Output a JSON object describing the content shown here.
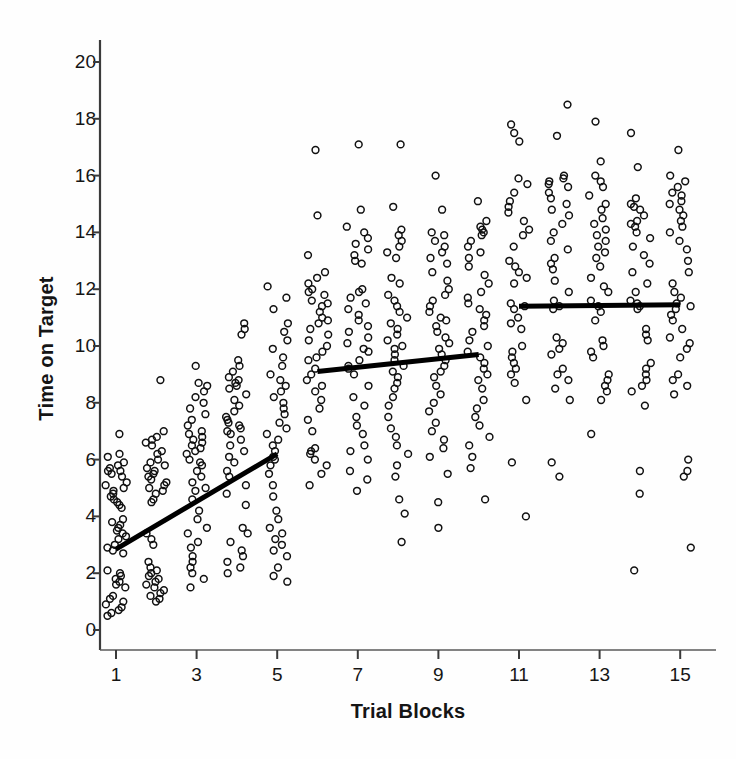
{
  "chart_data": {
    "type": "scatter",
    "title": "",
    "xlabel": "Trial Blocks",
    "ylabel": "Time on Target",
    "xlim": [
      0.3,
      15.8
    ],
    "ylim": [
      0,
      20.9
    ],
    "xticks": [
      1,
      3,
      5,
      7,
      9,
      11,
      13,
      15
    ],
    "yticks": [
      0,
      2,
      4,
      6,
      8,
      10,
      12,
      14,
      16,
      18,
      20
    ],
    "grid": false,
    "legend": null,
    "marker": "open-circle",
    "trendlines": [
      {
        "name": "phase-1-fit",
        "x0": 1.0,
        "y0": 2.85,
        "x1": 5.0,
        "y1": 6.2
      },
      {
        "name": "phase-2-fit",
        "x0": 6.0,
        "y0": 9.1,
        "x1": 10.0,
        "y1": 9.7
      },
      {
        "name": "phase-3-fit",
        "x0": 11.0,
        "y0": 11.4,
        "x1": 15.0,
        "y1": 11.45
      }
    ],
    "series": [
      {
        "name": "Block 1",
        "x": 1,
        "values": [
          6.9,
          6.2,
          6.1,
          5.9,
          5.8,
          5.7,
          5.6,
          5.6,
          5.5,
          5.4,
          5.2,
          5.1,
          5.0,
          4.9,
          4.8,
          4.7,
          4.6,
          4.5,
          4.4,
          4.3,
          3.9,
          3.8,
          3.7,
          3.6,
          3.5,
          3.4,
          3.3,
          3.2,
          3.0,
          2.9,
          2.8,
          2.7,
          2.1,
          2.0,
          1.9,
          1.8,
          1.7,
          1.6,
          1.5,
          1.2,
          1.1,
          1.0,
          0.9,
          0.8,
          0.7,
          0.6,
          0.5
        ]
      },
      {
        "name": "Block 2",
        "x": 2,
        "values": [
          8.8,
          7.0,
          6.8,
          6.7,
          6.6,
          6.5,
          6.3,
          6.2,
          6.0,
          5.9,
          5.8,
          5.7,
          5.6,
          5.5,
          5.4,
          5.3,
          5.2,
          5.1,
          5.0,
          4.9,
          4.8,
          4.6,
          4.5,
          3.4,
          3.2,
          3.0,
          2.4,
          2.2,
          2.1,
          2.0,
          1.9,
          1.8,
          1.7,
          1.6,
          1.5,
          1.4,
          1.3,
          1.2,
          1.1,
          1.0
        ]
      },
      {
        "name": "Block 3",
        "x": 3,
        "values": [
          9.3,
          8.7,
          8.6,
          8.4,
          8.2,
          8.0,
          7.8,
          7.6,
          7.4,
          7.2,
          7.0,
          6.9,
          6.8,
          6.7,
          6.6,
          6.5,
          6.4,
          6.3,
          6.2,
          6.0,
          5.9,
          5.8,
          5.6,
          5.4,
          5.2,
          5.0,
          4.9,
          4.6,
          4.2,
          3.9,
          3.6,
          3.4,
          3.1,
          2.9,
          2.6,
          2.4,
          2.2,
          2.0,
          1.8,
          1.5
        ]
      },
      {
        "name": "Block 4",
        "x": 4,
        "values": [
          10.8,
          10.6,
          10.4,
          9.5,
          9.3,
          9.1,
          8.9,
          8.8,
          8.7,
          8.6,
          8.5,
          8.3,
          8.1,
          7.9,
          7.7,
          7.5,
          7.4,
          7.3,
          7.2,
          7.1,
          7.0,
          6.9,
          6.7,
          6.5,
          6.3,
          6.1,
          5.9,
          5.6,
          5.4,
          5.1,
          4.8,
          4.4,
          3.6,
          3.4,
          3.1,
          2.8,
          2.6,
          2.4,
          2.2,
          2.0
        ]
      },
      {
        "name": "Block 5",
        "x": 5,
        "values": [
          12.1,
          11.7,
          11.3,
          10.8,
          10.5,
          10.2,
          9.9,
          9.6,
          9.3,
          9.0,
          8.8,
          8.6,
          8.4,
          8.2,
          8.0,
          7.8,
          7.6,
          7.3,
          7.1,
          6.9,
          6.7,
          6.5,
          6.3,
          6.1,
          6.0,
          5.8,
          5.5,
          5.1,
          4.7,
          4.2,
          3.9,
          3.6,
          3.4,
          3.2,
          3.0,
          2.8,
          2.6,
          2.2,
          1.9,
          1.7
        ]
      },
      {
        "name": "Block 6",
        "x": 6,
        "values": [
          16.9,
          14.6,
          13.2,
          12.6,
          12.4,
          12.2,
          12.0,
          11.9,
          11.8,
          11.6,
          11.5,
          11.4,
          11.2,
          11.0,
          10.9,
          10.8,
          10.6,
          10.4,
          10.2,
          10.0,
          9.8,
          9.6,
          9.5,
          9.2,
          9.0,
          8.8,
          8.6,
          8.4,
          8.1,
          7.8,
          7.4,
          7.0,
          6.4,
          6.3,
          6.2,
          6.0,
          5.8,
          5.5,
          5.1
        ]
      },
      {
        "name": "Block 7",
        "x": 7,
        "values": [
          17.1,
          14.8,
          14.2,
          14.0,
          13.8,
          13.6,
          13.4,
          13.2,
          13.0,
          12.9,
          12.0,
          11.9,
          11.7,
          11.5,
          11.3,
          11.1,
          10.9,
          10.7,
          10.5,
          10.3,
          10.1,
          9.9,
          9.8,
          9.5,
          9.3,
          9.2,
          9.0,
          8.6,
          8.2,
          7.9,
          7.5,
          7.2,
          6.9,
          6.5,
          6.3,
          6.0,
          5.6,
          5.3,
          4.9
        ]
      },
      {
        "name": "Block 8",
        "x": 8,
        "values": [
          17.1,
          14.9,
          14.1,
          13.9,
          13.7,
          13.5,
          13.3,
          13.1,
          12.4,
          12.2,
          11.8,
          11.6,
          11.4,
          11.2,
          11.0,
          10.8,
          10.6,
          10.4,
          10.2,
          10.0,
          9.9,
          9.7,
          9.5,
          9.3,
          9.1,
          8.9,
          8.7,
          8.5,
          8.2,
          7.9,
          7.5,
          7.1,
          6.8,
          6.5,
          6.2,
          5.8,
          5.4,
          4.6,
          4.1,
          3.1
        ]
      },
      {
        "name": "Block 9",
        "x": 9,
        "values": [
          16.0,
          14.8,
          14.0,
          13.9,
          13.7,
          13.5,
          13.3,
          13.1,
          12.9,
          12.6,
          12.3,
          12.0,
          11.8,
          11.6,
          11.4,
          11.2,
          11.0,
          10.9,
          10.7,
          10.5,
          10.3,
          10.1,
          9.9,
          9.7,
          9.5,
          9.3,
          9.1,
          8.9,
          8.6,
          8.3,
          8.0,
          7.7,
          7.3,
          7.0,
          6.7,
          6.4,
          6.1,
          5.5,
          4.5,
          3.6
        ]
      },
      {
        "name": "Block 10",
        "x": 10,
        "values": [
          15.1,
          14.4,
          14.2,
          14.1,
          14.0,
          13.9,
          13.7,
          13.5,
          13.3,
          13.1,
          12.8,
          12.5,
          12.2,
          11.9,
          11.7,
          11.5,
          11.3,
          11.1,
          10.9,
          10.7,
          10.5,
          10.2,
          10.0,
          9.8,
          9.6,
          9.4,
          9.2,
          9.0,
          8.8,
          8.5,
          8.1,
          7.8,
          7.5,
          7.2,
          6.8,
          6.5,
          6.1,
          5.7,
          4.6
        ]
      },
      {
        "name": "Block 11",
        "x": 11,
        "values": [
          17.8,
          17.5,
          17.2,
          15.9,
          15.7,
          15.4,
          15.1,
          14.9,
          14.7,
          14.4,
          14.1,
          13.9,
          13.5,
          13.0,
          12.8,
          12.6,
          12.4,
          12.2,
          11.5,
          11.4,
          11.3,
          11.0,
          10.8,
          10.6,
          10.0,
          9.8,
          9.6,
          9.4,
          9.2,
          9.0,
          8.7,
          8.1,
          5.9,
          4.0
        ]
      },
      {
        "name": "Block 12",
        "x": 12,
        "values": [
          18.5,
          17.4,
          16.0,
          15.9,
          15.8,
          15.7,
          15.6,
          15.4,
          15.2,
          15.0,
          14.8,
          14.6,
          14.3,
          14.0,
          13.7,
          13.4,
          13.1,
          12.9,
          12.7,
          12.3,
          11.9,
          11.6,
          11.4,
          11.3,
          10.3,
          10.1,
          9.9,
          9.7,
          9.2,
          9.0,
          8.8,
          8.5,
          8.1,
          5.9,
          5.4
        ]
      },
      {
        "name": "Block 13",
        "x": 13,
        "values": [
          17.9,
          16.5,
          16.0,
          15.8,
          15.6,
          15.3,
          15.0,
          14.8,
          14.5,
          14.3,
          14.1,
          13.9,
          13.7,
          13.5,
          13.3,
          13.1,
          12.8,
          12.4,
          12.1,
          11.9,
          11.6,
          11.4,
          11.2,
          10.9,
          10.2,
          10.0,
          9.8,
          9.6,
          9.0,
          8.8,
          8.6,
          8.4,
          8.1,
          6.9
        ]
      },
      {
        "name": "Block 14",
        "x": 14,
        "values": [
          17.5,
          16.3,
          15.2,
          15.0,
          14.9,
          14.8,
          14.6,
          14.4,
          14.3,
          14.2,
          14.0,
          13.8,
          13.5,
          13.2,
          12.9,
          12.6,
          12.2,
          11.9,
          11.6,
          11.5,
          11.4,
          11.3,
          10.6,
          10.4,
          10.2,
          9.4,
          9.2,
          9.0,
          8.8,
          8.6,
          8.4,
          7.9,
          5.6,
          4.8,
          2.1
        ]
      },
      {
        "name": "Block 15",
        "x": 15,
        "values": [
          16.9,
          16.0,
          15.8,
          15.6,
          15.4,
          15.3,
          15.1,
          15.0,
          14.8,
          14.6,
          14.4,
          14.2,
          14.0,
          13.7,
          13.4,
          13.0,
          12.6,
          12.2,
          11.9,
          11.7,
          11.5,
          11.4,
          11.3,
          11.1,
          10.9,
          10.6,
          10.3,
          10.1,
          9.9,
          9.6,
          9.0,
          8.8,
          8.6,
          8.3,
          6.0,
          5.6,
          5.4,
          2.9
        ]
      }
    ]
  }
}
